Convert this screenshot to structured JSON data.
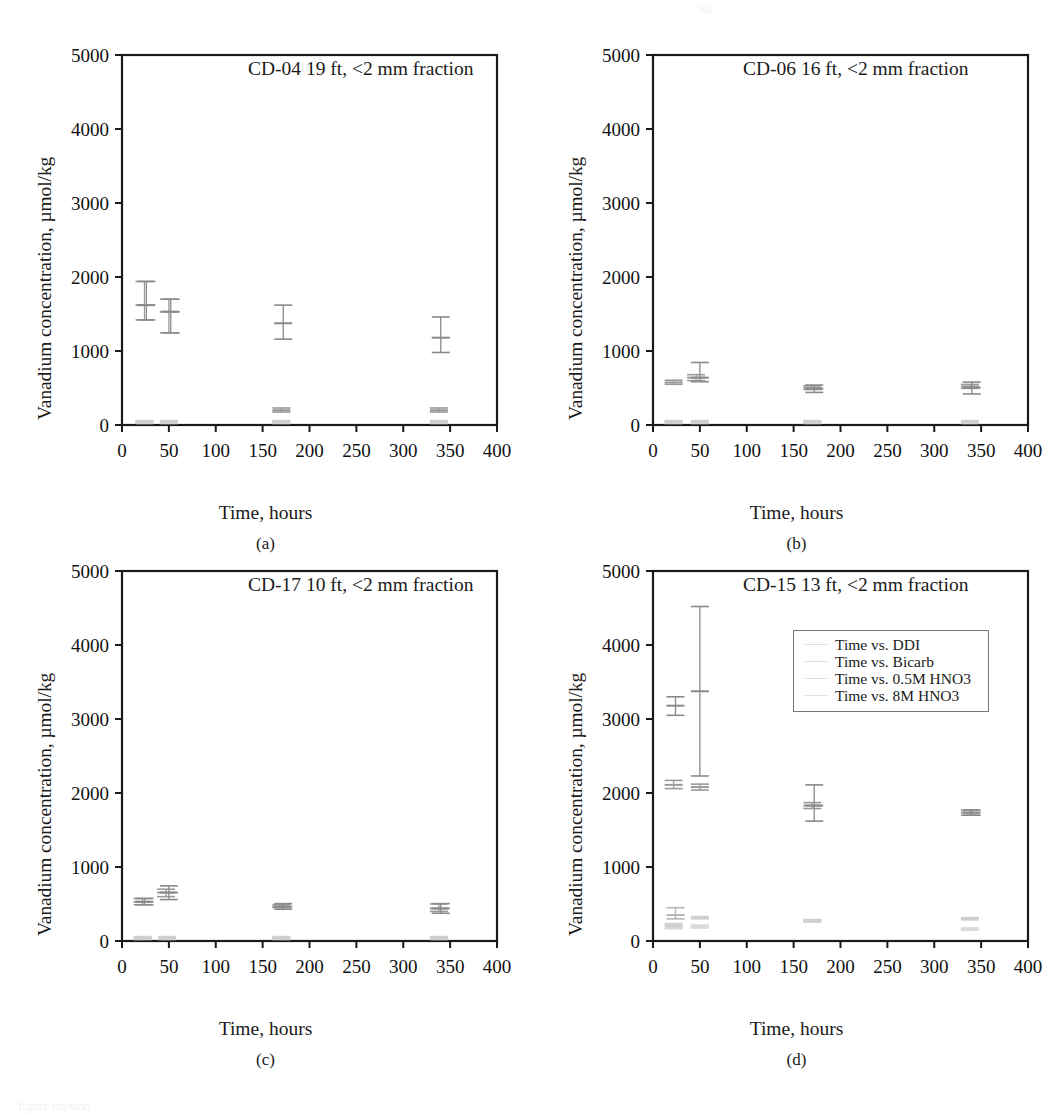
{
  "figure": {
    "panel_letters": [
      "(a)",
      "(b)",
      "(c)",
      "(d)"
    ],
    "xlabel": "Time, hours",
    "ylabel": "Vanadium concentration, µmol/kg",
    "x_ticks": [
      "0",
      "50",
      "100",
      "150",
      "200",
      "250",
      "300",
      "350",
      "400"
    ],
    "y_ticks": [
      "0",
      "1000",
      "2000",
      "3000",
      "4000",
      "5000"
    ],
    "top_artifact": "gg",
    "bottom_caption": "figure caption"
  },
  "legend": {
    "position": "inside-top-right-panel-d",
    "entries": [
      {
        "label": "Time vs. DDI",
        "color": "#d9d9d9",
        "marker": "hline"
      },
      {
        "label": "Time vs. Bicarb",
        "color": "#d0d0d0",
        "marker": "hline"
      },
      {
        "label": "Time vs. 0.5M HNO3",
        "color": "#c8c8c8",
        "marker": "hline"
      },
      {
        "label": "Time vs. 8M HNO3",
        "color": "#999999",
        "marker": "hline"
      }
    ]
  },
  "chart_data": [
    {
      "panel": "(a)",
      "type": "scatter",
      "title": "CD-04 19 ft, <2 mm fraction",
      "xlabel": "Time, hours",
      "ylabel": "Vanadium concentration, µmol/kg",
      "xlim": [
        0,
        400
      ],
      "ylim": [
        0,
        5000
      ],
      "xticks": [
        0,
        50,
        100,
        150,
        200,
        250,
        300,
        350,
        400
      ],
      "yticks": [
        0,
        1000,
        2000,
        3000,
        4000,
        5000
      ],
      "grid": false,
      "errorbars": true,
      "series": [
        {
          "name": "Time vs. DDI",
          "color": "#d9d9d9",
          "points": [
            {
              "x": 24,
              "y": 30,
              "yerr_low": 20,
              "yerr_high": 45
            },
            {
              "x": 50,
              "y": 30,
              "yerr_low": 20,
              "yerr_high": 45
            },
            {
              "x": 170,
              "y": 30,
              "yerr_low": 20,
              "yerr_high": 45
            },
            {
              "x": 338,
              "y": 30,
              "yerr_low": 20,
              "yerr_high": 45
            }
          ]
        },
        {
          "name": "Time vs. Bicarb",
          "color": "#cfcfcf",
          "points": [
            {
              "x": 24,
              "y": 45,
              "yerr_low": 30,
              "yerr_high": 60
            },
            {
              "x": 50,
              "y": 45,
              "yerr_low": 30,
              "yerr_high": 60
            },
            {
              "x": 170,
              "y": 45,
              "yerr_low": 30,
              "yerr_high": 60
            },
            {
              "x": 338,
              "y": 45,
              "yerr_low": 30,
              "yerr_high": 60
            }
          ]
        },
        {
          "name": "Time vs. 0.5M HNO3",
          "color": "#9a9a9a",
          "points": [
            {
              "x": 24,
              "y": 1620,
              "yerr_low": 1420,
              "yerr_high": 1940
            },
            {
              "x": 50,
              "y": 1530,
              "yerr_low": 1245,
              "yerr_high": 1700
            },
            {
              "x": 170,
              "y": 200,
              "yerr_low": 175,
              "yerr_high": 230
            },
            {
              "x": 338,
              "y": 200,
              "yerr_low": 175,
              "yerr_high": 230
            }
          ]
        },
        {
          "name": "Time vs. 8M HNO3",
          "color": "#8a8a8a",
          "points": [
            {
              "x": 26,
              "y": 1620,
              "yerr_low": 1420,
              "yerr_high": 1940
            },
            {
              "x": 52,
              "y": 1530,
              "yerr_low": 1245,
              "yerr_high": 1700
            },
            {
              "x": 172,
              "y": 1375,
              "yerr_low": 1160,
              "yerr_high": 1620
            },
            {
              "x": 340,
              "y": 1180,
              "yerr_low": 980,
              "yerr_high": 1460
            }
          ]
        }
      ]
    },
    {
      "panel": "(b)",
      "type": "scatter",
      "title": "CD-06 16 ft, <2 mm fraction",
      "xlabel": "Time, hours",
      "ylabel": "Vanadium concentration, µmol/kg",
      "xlim": [
        0,
        400
      ],
      "ylim": [
        0,
        5000
      ],
      "xticks": [
        0,
        50,
        100,
        150,
        200,
        250,
        300,
        350,
        400
      ],
      "yticks": [
        0,
        1000,
        2000,
        3000,
        4000,
        5000
      ],
      "grid": false,
      "errorbars": true,
      "series": [
        {
          "name": "Time vs. DDI",
          "color": "#d9d9d9",
          "points": [
            {
              "x": 22,
              "y": 30,
              "yerr_low": 20,
              "yerr_high": 45
            },
            {
              "x": 50,
              "y": 30,
              "yerr_low": 20,
              "yerr_high": 45
            },
            {
              "x": 170,
              "y": 30,
              "yerr_low": 20,
              "yerr_high": 45
            },
            {
              "x": 338,
              "y": 30,
              "yerr_low": 20,
              "yerr_high": 45
            }
          ]
        },
        {
          "name": "Time vs. Bicarb",
          "color": "#cfcfcf",
          "points": [
            {
              "x": 22,
              "y": 45,
              "yerr_low": 30,
              "yerr_high": 60
            },
            {
              "x": 50,
              "y": 45,
              "yerr_low": 30,
              "yerr_high": 60
            },
            {
              "x": 170,
              "y": 45,
              "yerr_low": 30,
              "yerr_high": 60
            },
            {
              "x": 338,
              "y": 45,
              "yerr_low": 30,
              "yerr_high": 60
            }
          ]
        },
        {
          "name": "Time vs. 0.5M HNO3",
          "color": "#9a9a9a",
          "points": [
            {
              "x": 22,
              "y": 575,
              "yerr_low": 550,
              "yerr_high": 605
            },
            {
              "x": 46,
              "y": 640,
              "yerr_low": 600,
              "yerr_high": 680
            },
            {
              "x": 170,
              "y": 505,
              "yerr_low": 480,
              "yerr_high": 530
            },
            {
              "x": 338,
              "y": 520,
              "yerr_low": 495,
              "yerr_high": 548
            }
          ]
        },
        {
          "name": "Time vs. 8M HNO3",
          "color": "#8a8a8a",
          "points": [
            {
              "x": 50,
              "y": 640,
              "yerr_low": 585,
              "yerr_high": 845
            },
            {
              "x": 172,
              "y": 490,
              "yerr_low": 440,
              "yerr_high": 540
            },
            {
              "x": 340,
              "y": 505,
              "yerr_low": 420,
              "yerr_high": 580
            }
          ]
        }
      ]
    },
    {
      "panel": "(c)",
      "type": "scatter",
      "title": "CD-17 10 ft, <2 mm fraction",
      "xlabel": "Time, hours",
      "ylabel": "Vanadium concentration, µmol/kg",
      "xlim": [
        0,
        400
      ],
      "ylim": [
        0,
        5000
      ],
      "xticks": [
        0,
        50,
        100,
        150,
        200,
        250,
        300,
        350,
        400
      ],
      "yticks": [
        0,
        1000,
        2000,
        3000,
        4000,
        5000
      ],
      "grid": false,
      "errorbars": true,
      "series": [
        {
          "name": "Time vs. DDI",
          "color": "#d9d9d9",
          "points": [
            {
              "x": 22,
              "y": 30,
              "yerr_low": 20,
              "yerr_high": 45
            },
            {
              "x": 48,
              "y": 30,
              "yerr_low": 20,
              "yerr_high": 45
            },
            {
              "x": 170,
              "y": 30,
              "yerr_low": 20,
              "yerr_high": 45
            },
            {
              "x": 338,
              "y": 30,
              "yerr_low": 20,
              "yerr_high": 45
            }
          ]
        },
        {
          "name": "Time vs. Bicarb",
          "color": "#cfcfcf",
          "points": [
            {
              "x": 22,
              "y": 45,
              "yerr_low": 30,
              "yerr_high": 60
            },
            {
              "x": 48,
              "y": 45,
              "yerr_low": 30,
              "yerr_high": 60
            },
            {
              "x": 170,
              "y": 45,
              "yerr_low": 30,
              "yerr_high": 60
            },
            {
              "x": 338,
              "y": 45,
              "yerr_low": 30,
              "yerr_high": 60
            }
          ]
        },
        {
          "name": "Time vs. 0.5M HNO3",
          "color": "#9a9a9a",
          "points": [
            {
              "x": 22,
              "y": 530,
              "yerr_low": 490,
              "yerr_high": 575
            },
            {
              "x": 47,
              "y": 655,
              "yerr_low": 600,
              "yerr_high": 700
            },
            {
              "x": 170,
              "y": 465,
              "yerr_low": 450,
              "yerr_high": 490
            },
            {
              "x": 338,
              "y": 440,
              "yerr_low": 400,
              "yerr_high": 500
            }
          ]
        },
        {
          "name": "Time vs. 8M HNO3",
          "color": "#8a8a8a",
          "points": [
            {
              "x": 24,
              "y": 530,
              "yerr_low": 490,
              "yerr_high": 575
            },
            {
              "x": 50,
              "y": 655,
              "yerr_low": 560,
              "yerr_high": 745
            },
            {
              "x": 172,
              "y": 465,
              "yerr_low": 430,
              "yerr_high": 505
            },
            {
              "x": 340,
              "y": 440,
              "yerr_low": 375,
              "yerr_high": 505
            }
          ]
        }
      ]
    },
    {
      "panel": "(d)",
      "type": "scatter",
      "title": "CD-15 13 ft, <2 mm fraction",
      "xlabel": "Time, hours",
      "ylabel": "Vanadium concentration, µmol/kg",
      "xlim": [
        0,
        400
      ],
      "ylim": [
        0,
        5000
      ],
      "xticks": [
        0,
        50,
        100,
        150,
        200,
        250,
        300,
        350,
        400
      ],
      "yticks": [
        0,
        1000,
        2000,
        3000,
        4000,
        5000
      ],
      "grid": false,
      "errorbars": true,
      "series": [
        {
          "name": "Time vs. DDI",
          "color": "#d9d9d9",
          "points": [
            {
              "x": 22,
              "y": 185,
              "yerr_low": 165,
              "yerr_high": 205
            },
            {
              "x": 50,
              "y": 195,
              "yerr_low": 175,
              "yerr_high": 215
            },
            {
              "x": 170,
              "y": 270,
              "yerr_low": 255,
              "yerr_high": 285
            },
            {
              "x": 338,
              "y": 160,
              "yerr_low": 145,
              "yerr_high": 175
            }
          ]
        },
        {
          "name": "Time vs. Bicarb",
          "color": "#cfcfcf",
          "points": [
            {
              "x": 22,
              "y": 215,
              "yerr_low": 195,
              "yerr_high": 235
            },
            {
              "x": 50,
              "y": 315,
              "yerr_low": 300,
              "yerr_high": 330
            },
            {
              "x": 170,
              "y": 275,
              "yerr_low": 260,
              "yerr_high": 290
            },
            {
              "x": 338,
              "y": 300,
              "yerr_low": 285,
              "yerr_high": 315
            }
          ]
        },
        {
          "name": "Time vs. 0.5M HNO3",
          "color": "#9a9a9a",
          "points": [
            {
              "x": 22,
              "y": 2110,
              "yerr_low": 2060,
              "yerr_high": 2170
            },
            {
              "x": 50,
              "y": 2080,
              "yerr_low": 2040,
              "yerr_high": 2120
            },
            {
              "x": 170,
              "y": 1830,
              "yerr_low": 1790,
              "yerr_high": 1870
            },
            {
              "x": 338,
              "y": 1735,
              "yerr_low": 1700,
              "yerr_high": 1770
            }
          ]
        },
        {
          "name": "Time vs. 8M HNO3",
          "color": "#8a8a8a",
          "points": [
            {
              "x": 24,
              "y": 3180,
              "yerr_low": 3050,
              "yerr_high": 3300
            },
            {
              "x": 50,
              "y": 3375,
              "yerr_low": 2230,
              "yerr_high": 4520
            },
            {
              "x": 172,
              "y": 1830,
              "yerr_low": 1620,
              "yerr_high": 2110
            },
            {
              "x": 340,
              "y": 1735,
              "yerr_low": 1700,
              "yerr_high": 1770
            }
          ]
        },
        {
          "name": "Time vs. DDI (extra)",
          "color": "#b5b5b5",
          "points": [
            {
              "x": 24,
              "y": 350,
              "yerr_low": 300,
              "yerr_high": 450
            }
          ]
        }
      ]
    }
  ]
}
